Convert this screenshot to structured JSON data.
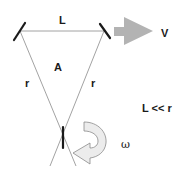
{
  "diagram": {
    "type": "sagnac-interferometer-rotation",
    "labels": {
      "top_side": "L",
      "velocity": "V",
      "area": "A",
      "left_side": "r",
      "right_side": "r",
      "condition": "L << r",
      "angular_velocity": "ω"
    },
    "colors": {
      "line": "#8a8a8a",
      "mirror": "#1a1a1a",
      "velocity_arrow": "#b3b3b3",
      "rotation_arrow_fill": "#ececec",
      "rotation_arrow_stroke": "#8a8a8a",
      "text": "#1a1a1a",
      "background": "#ffffff"
    },
    "elements": [
      {
        "name": "left-mirror",
        "kind": "mirror"
      },
      {
        "name": "right-mirror",
        "kind": "mirror"
      },
      {
        "name": "bottom-mirror",
        "kind": "mirror"
      },
      {
        "name": "velocity-arrow",
        "kind": "straight-arrow",
        "direction": "right"
      },
      {
        "name": "rotation-arrow",
        "kind": "curved-arrow",
        "direction": "clockwise"
      }
    ]
  }
}
